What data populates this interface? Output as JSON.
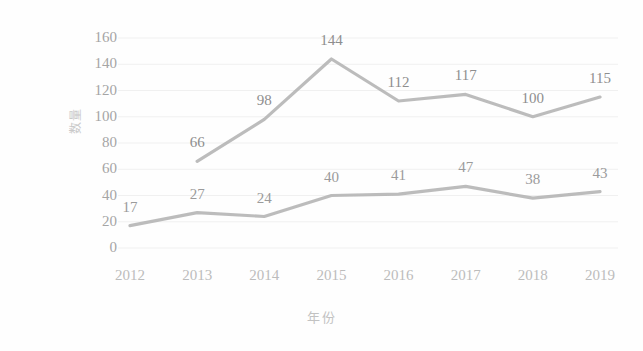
{
  "chart_data": {
    "type": "line",
    "title": "",
    "subtitle": "",
    "xlabel": "年份",
    "ylabel": "数量",
    "categories": [
      "2012",
      "2013",
      "2014",
      "2015",
      "2016",
      "2017",
      "2018",
      "2019"
    ],
    "x": [
      2012,
      2013,
      2014,
      2015,
      2016,
      2017,
      2018,
      2019
    ],
    "series": [
      {
        "name": "upper-series",
        "values": [
          null,
          66,
          98,
          144,
          112,
          117,
          100,
          115
        ],
        "color": "#b0b0b0",
        "labels": [
          "",
          "66",
          "98",
          "144",
          "112",
          "117",
          "100",
          "115"
        ]
      },
      {
        "name": "lower-series",
        "values": [
          17,
          27,
          24,
          40,
          41,
          47,
          38,
          43
        ],
        "color": "#b0b0b0",
        "labels": [
          "17",
          "27",
          "24",
          "40",
          "41",
          "47",
          "38",
          "43"
        ]
      }
    ],
    "ylim": [
      0,
      160
    ],
    "ytick_step": 20,
    "yticks": [
      "160",
      "140",
      "120",
      "100",
      "80",
      "60",
      "40",
      "20",
      "0"
    ],
    "grid": true,
    "grid_axis": "y",
    "grid_color": "#f0f0f0",
    "legend": false,
    "legend_position": "none",
    "data_labels_shown": true,
    "background_color": "#fefefe",
    "axis_text_color": "#a5a5a5"
  }
}
